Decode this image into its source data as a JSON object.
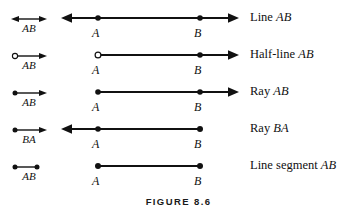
{
  "figure": {
    "caption": "FIGURE 8.6",
    "rows": [
      {
        "notation_label": "AB",
        "notation_symbol": "double-arrow",
        "description_prefix": "Line ",
        "description_points": "AB",
        "point_a_label": "A",
        "point_b_label": "B",
        "left_end": "arrow",
        "right_end": "arrow",
        "point_a_marker": "filled-dot",
        "point_b_marker": "filled-dot",
        "line_start_x": 8,
        "line_end_x": 182
      },
      {
        "notation_label": "AB",
        "notation_symbol": "open-circle-right-arrow",
        "description_prefix": "Half-line ",
        "description_points": "AB",
        "point_a_label": "A",
        "point_b_label": "B",
        "left_end": "open-circle",
        "right_end": "arrow",
        "point_a_marker": "open-circle",
        "point_b_marker": "filled-dot",
        "line_start_x": 42,
        "line_end_x": 182
      },
      {
        "notation_label": "AB",
        "notation_symbol": "dot-right-arrow",
        "description_prefix": "Ray ",
        "description_points": "AB",
        "point_a_label": "A",
        "point_b_label": "B",
        "left_end": "dot",
        "right_end": "arrow",
        "point_a_marker": "filled-dot",
        "point_b_marker": "filled-dot",
        "line_start_x": 42,
        "line_end_x": 182
      },
      {
        "notation_label": "BA",
        "notation_symbol": "dot-right-arrow",
        "description_prefix": "Ray ",
        "description_points": "BA",
        "point_a_label": "A",
        "point_b_label": "B",
        "left_end": "arrow",
        "right_end": "dot",
        "point_a_marker": "filled-dot",
        "point_b_marker": "filled-dot",
        "line_start_x": 8,
        "line_end_x": 145
      },
      {
        "notation_label": "AB",
        "notation_symbol": "dot-line-dot",
        "description_prefix": "Line segment ",
        "description_points": "AB",
        "point_a_label": "A",
        "point_b_label": "B",
        "left_end": "dot",
        "right_end": "dot",
        "point_a_marker": "filled-dot",
        "point_b_marker": "filled-dot",
        "line_start_x": 42,
        "line_end_x": 145
      }
    ]
  },
  "colors": {
    "ink": "#111111",
    "background": "#ffffff"
  }
}
